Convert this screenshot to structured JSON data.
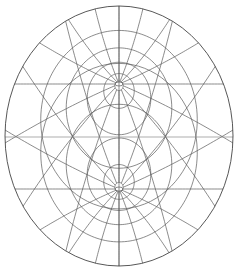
{
  "figure": {
    "type": "map-projection-graticule",
    "outline": {
      "cx": 119,
      "cy": 136,
      "rx": 114,
      "ry": 130
    },
    "equator_y": 137,
    "poles": [
      {
        "name": "north-pole",
        "cx": 119,
        "cy": 84
      },
      {
        "name": "south-pole",
        "cx": 119,
        "cy": 189
      }
    ],
    "line_color": "#5a5a5a",
    "background": "#ffffff"
  }
}
